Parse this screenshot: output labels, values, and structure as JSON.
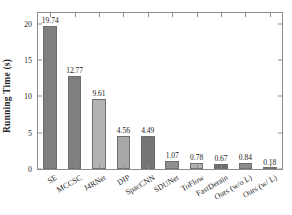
{
  "chart_data": {
    "type": "bar",
    "title": "",
    "xlabel": "",
    "ylabel": "Running Time (s)",
    "ylim": [
      0,
      21.5
    ],
    "yticks": [
      0,
      5,
      10,
      15,
      20
    ],
    "grid": false,
    "legend": "none",
    "categories": [
      "SE",
      "MCCSC",
      "J4RNet",
      "DIP",
      "SpacCNN",
      "SDUNet",
      "ToFlow",
      "FastDerain",
      "Ours (w/o L)",
      "Ours (w/ L)"
    ],
    "values": [
      19.74,
      12.77,
      9.61,
      4.56,
      4.49,
      1.07,
      0.78,
      0.67,
      0.84,
      0.18
    ],
    "value_labels": [
      "19.74",
      "12.77",
      "9.61",
      "4.56",
      "4.49",
      "1.07",
      "0.78",
      "0.67",
      "0.84",
      "0.18"
    ],
    "bar_colors": [
      "#7f7f7f",
      "#7f7f7f",
      "#b3b3b3",
      "#a8a8a8",
      "#757575",
      "#8f8f8f",
      "#b0b0b0",
      "#6e6e6e",
      "#8a8a8a",
      "#c9c9c9"
    ],
    "ytick_labels": [
      "0",
      "5",
      "10",
      "15",
      "20"
    ],
    "axis_color": "#8c8c8c",
    "text_color": "#2b2b2b"
  }
}
